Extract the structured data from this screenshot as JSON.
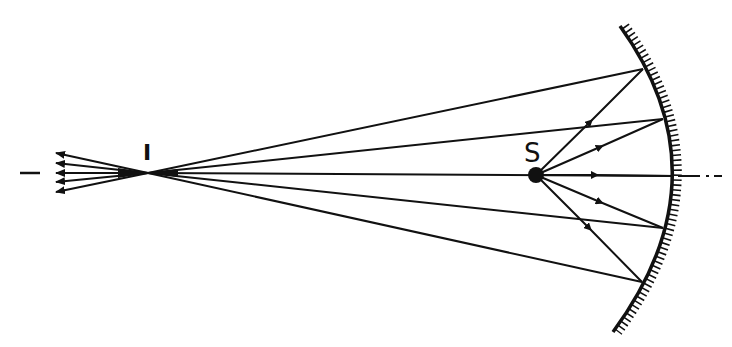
{
  "diagram": {
    "title": "",
    "labels": {
      "source": "S",
      "image": "I"
    },
    "colors": {
      "ink": "#111111",
      "background": "#ffffff"
    },
    "elements": {
      "source_point": {
        "x": 536,
        "y": 175,
        "label": "S"
      },
      "image_point": {
        "x": 148,
        "y": 173,
        "label": "I"
      },
      "optical_axis": {
        "y": 174,
        "style": "dash-dot"
      },
      "concave_mirror": {
        "top_end": {
          "x": 620,
          "y": 26
        },
        "vertex": {
          "x": 673,
          "y": 176
        },
        "bottom_end": {
          "x": 613,
          "y": 332
        },
        "hatching": "back side (right)"
      },
      "reflection_points": [
        {
          "x": 643,
          "y": 69
        },
        {
          "x": 663,
          "y": 119
        },
        {
          "x": 673,
          "y": 176
        },
        {
          "x": 663,
          "y": 228
        },
        {
          "x": 642,
          "y": 282
        }
      ],
      "arrow_tips_left": [
        {
          "x": 56,
          "y": 153
        },
        {
          "x": 56,
          "y": 163
        },
        {
          "x": 56,
          "y": 173
        },
        {
          "x": 56,
          "y": 182
        },
        {
          "x": 56,
          "y": 192
        }
      ]
    }
  }
}
